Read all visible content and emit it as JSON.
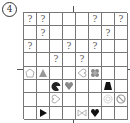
{
  "puzzle": {
    "number_label": "4",
    "rows": 8,
    "cols": 8,
    "cells": [
      [
        "?",
        "?",
        "",
        "",
        "",
        "?",
        "",
        "?"
      ],
      [
        "",
        "?",
        "",
        "",
        "",
        "",
        "?",
        ""
      ],
      [
        "?",
        "",
        "",
        "?",
        "",
        "?",
        "",
        ""
      ],
      [
        "",
        "",
        "?",
        "",
        "?",
        "",
        "",
        ""
      ],
      [
        "icon:pentagon-outline",
        "icon:triangle-gray",
        "",
        "",
        "icon:heart-outline-left",
        "icon:flower-gray",
        "",
        ""
      ],
      [
        "",
        "",
        "icon:pacman-black",
        "icon:heart-gray",
        "",
        "",
        "icon:trapezoid-black",
        ""
      ],
      [
        "",
        "",
        "icon:heart-outline-right",
        "",
        "",
        "",
        "icon:circle-pattern-gray",
        "icon:no-sign-gray"
      ],
      [
        "",
        "icon:triangle-right-black",
        "",
        "",
        "icon:bowtie-outline",
        "icon:heart-black",
        "",
        ""
      ]
    ]
  }
}
